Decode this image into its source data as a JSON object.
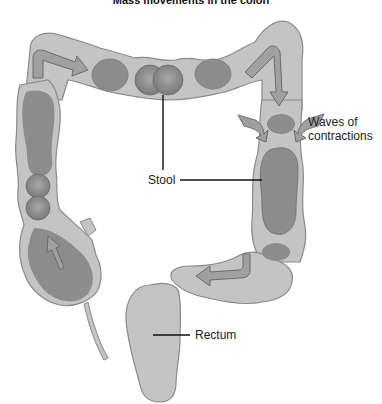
{
  "title": "Mass movements in the colon",
  "labels": {
    "stool": "Stool",
    "waves_line1": "Waves of",
    "waves_line2": "contractions",
    "rectum": "Rectum"
  },
  "colors": {
    "colon_wall": "#c4c4c4",
    "colon_outline": "#8a8a8a",
    "stool": "#8c8c8c",
    "arrow_fill": "#a0a0a0",
    "leader_line": "#111111"
  }
}
